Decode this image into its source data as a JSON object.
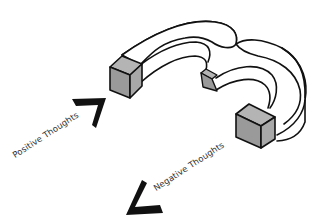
{
  "diagram": {
    "labels": {
      "positive": "Positive Thoughts",
      "negative": "Negative Thoughts"
    },
    "colors": {
      "background": "#ffffff",
      "outline": "#111111",
      "pole_face": "#9a9a9a",
      "pole_side": "#b4b4b4",
      "arrow": "#111111",
      "label_text": "#333333"
    },
    "arrows": [
      {
        "id": "positive",
        "direction": "toward magnet (up-right)"
      },
      {
        "id": "negative",
        "direction": "away from magnet (down-left)"
      }
    ]
  }
}
